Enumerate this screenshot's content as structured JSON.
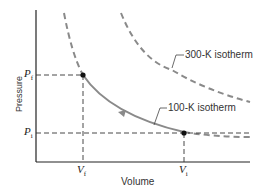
{
  "diagram": {
    "type": "pressure-volume diagram",
    "x_axis_label": "Volume",
    "y_axis_label": "Pressure",
    "isotherm_high_label": "300-K isotherm",
    "isotherm_low_label": "100-K isotherm",
    "points": {
      "final": {
        "pressure_label": "P",
        "pressure_sub": "f",
        "volume_label": "V",
        "volume_sub": "f"
      },
      "initial": {
        "pressure_label": "P",
        "pressure_sub": "i",
        "volume_label": "V",
        "volume_sub": "i"
      }
    },
    "process_direction": "from initial (Vi, Pi) to final (Vf, Pf) along 100-K isotherm",
    "colors": {
      "axes": "#222222",
      "isotherm": "#8a8a8a",
      "guides": "#333333",
      "points": "#111111"
    }
  }
}
